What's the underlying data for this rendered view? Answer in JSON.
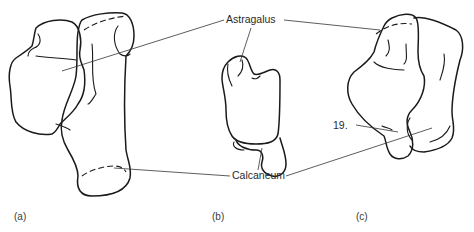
{
  "figure": {
    "labels": {
      "astragalus": "Astragalus",
      "calcaneum": "Calcaneum",
      "marker_19": "19."
    },
    "panels": [
      {
        "id": "a",
        "label": "(a)"
      },
      {
        "id": "b",
        "label": "(b)"
      },
      {
        "id": "c",
        "label": "(c)"
      }
    ],
    "colors": {
      "line": "#1a1a1a",
      "text": "#2a2a2a",
      "background": "#ffffff"
    }
  }
}
